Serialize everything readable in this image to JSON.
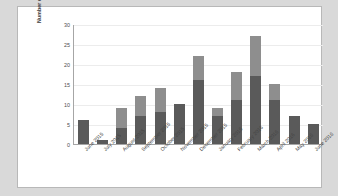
{
  "chart_data": {
    "type": "bar",
    "stacked": true,
    "title": "",
    "xlabel": "",
    "ylabel": "Number of samples",
    "ylim": [
      0,
      30
    ],
    "yticks": [
      0,
      5,
      10,
      15,
      20,
      25,
      30
    ],
    "grid": true,
    "legend": "none",
    "categories": [
      "June 2015",
      "July 2015",
      "August 2015",
      "September 2015",
      "October 2015",
      "November 2015",
      "December 2015",
      "January 2016",
      "February 2016",
      "March 2016",
      "April 2016",
      "May 2016",
      "June 2016"
    ],
    "series": [
      {
        "name": "lower-segment",
        "color": "#5a5a5a",
        "values": [
          6,
          1,
          4,
          7,
          8,
          10,
          16,
          7,
          11,
          17,
          11,
          7,
          5
        ]
      },
      {
        "name": "upper-segment",
        "color": "#8e8e8e",
        "values": [
          0,
          0,
          5,
          5,
          6,
          0,
          6,
          2,
          7,
          10,
          4,
          0,
          0
        ]
      }
    ],
    "totals": [
      6,
      1,
      9,
      12,
      14,
      10,
      22,
      9,
      18,
      27,
      15,
      7,
      5
    ]
  },
  "figure": {
    "frame_border_color": "#b8b8b8",
    "plot_background": "#ffffff",
    "page_background": "#d9d9d9",
    "gridline_color": "#ececec",
    "axis_color": "#a6a6a6"
  }
}
